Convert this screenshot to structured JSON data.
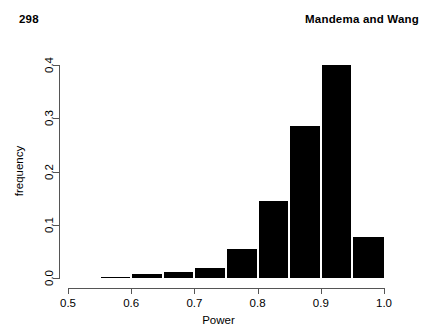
{
  "header": {
    "folio": "298",
    "running_head": "Mandema and Wang"
  },
  "chart_data": {
    "type": "bar",
    "title": "",
    "subtitle": "",
    "xlabel": "Power",
    "ylabel": "frequency",
    "xlim": [
      0.5,
      1.0
    ],
    "ylim": [
      0.0,
      0.4
    ],
    "grid": false,
    "legend": null,
    "bar_color": "#000000",
    "axis_color": "#555555",
    "bin_width": 0.05,
    "xtick_labels": [
      "0.5",
      "0.6",
      "0.7",
      "0.8",
      "0.9",
      "1.0"
    ],
    "xtick_values": [
      0.5,
      0.6,
      0.7,
      0.8,
      0.9,
      1.0
    ],
    "ytick_labels": [
      "0.0",
      "0.1",
      "0.2",
      "0.3",
      "0.4"
    ],
    "ytick_values": [
      0.0,
      0.1,
      0.2,
      0.3,
      0.4
    ],
    "bins": [
      {
        "x0": 0.5,
        "x1": 0.55,
        "value": 0.0
      },
      {
        "x0": 0.55,
        "x1": 0.6,
        "value": 0.002
      },
      {
        "x0": 0.6,
        "x1": 0.65,
        "value": 0.007
      },
      {
        "x0": 0.65,
        "x1": 0.7,
        "value": 0.012
      },
      {
        "x0": 0.7,
        "x1": 0.75,
        "value": 0.018
      },
      {
        "x0": 0.75,
        "x1": 0.8,
        "value": 0.055
      },
      {
        "x0": 0.8,
        "x1": 0.85,
        "value": 0.145
      },
      {
        "x0": 0.85,
        "x1": 0.9,
        "value": 0.285
      },
      {
        "x0": 0.9,
        "x1": 0.95,
        "value": 0.4
      },
      {
        "x0": 0.95,
        "x1": 1.0,
        "value": 0.077
      }
    ],
    "categories": [
      "0.50-0.55",
      "0.55-0.60",
      "0.60-0.65",
      "0.65-0.70",
      "0.70-0.75",
      "0.75-0.80",
      "0.80-0.85",
      "0.85-0.90",
      "0.90-0.95",
      "0.95-1.00"
    ],
    "values": [
      0.0,
      0.002,
      0.007,
      0.012,
      0.018,
      0.055,
      0.145,
      0.285,
      0.4,
      0.077
    ]
  }
}
